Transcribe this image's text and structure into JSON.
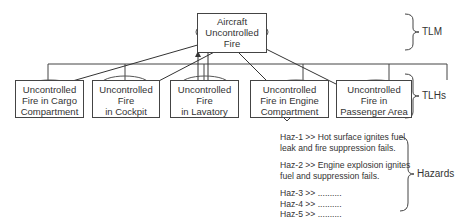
{
  "tlm": {
    "lines": [
      "Aircraft",
      "Uncontrolled",
      "Fire"
    ]
  },
  "tlhs": [
    {
      "lines": [
        "Uncontrolled",
        "Fire in Cargo",
        "Compartment"
      ]
    },
    {
      "lines": [
        "Uncontrolled",
        "Fire",
        "in Cockpit"
      ]
    },
    {
      "lines": [
        "Uncontrolled",
        "Fire",
        "in Lavatory"
      ]
    },
    {
      "lines": [
        "Uncontrolled",
        "Fire in Engine",
        "Compartment"
      ]
    },
    {
      "lines": [
        "Uncontrolled",
        "Fire in",
        "Passenger Area"
      ]
    }
  ],
  "hazards": {
    "h1": [
      "Haz-1 >> Hot surface ignites fuel",
      "leak and fire suppression fails."
    ],
    "h2": [
      "Haz-2 >> Engine explosion ignites",
      "fuel and suppression fails."
    ],
    "h3": "Haz-3 >> ..........",
    "h4": "Haz-4 >> ..........",
    "h5": "Haz-5 >> .........."
  },
  "levels": {
    "tlm": "TLM",
    "tlhs": "TLHs",
    "hazards": "Hazards"
  }
}
